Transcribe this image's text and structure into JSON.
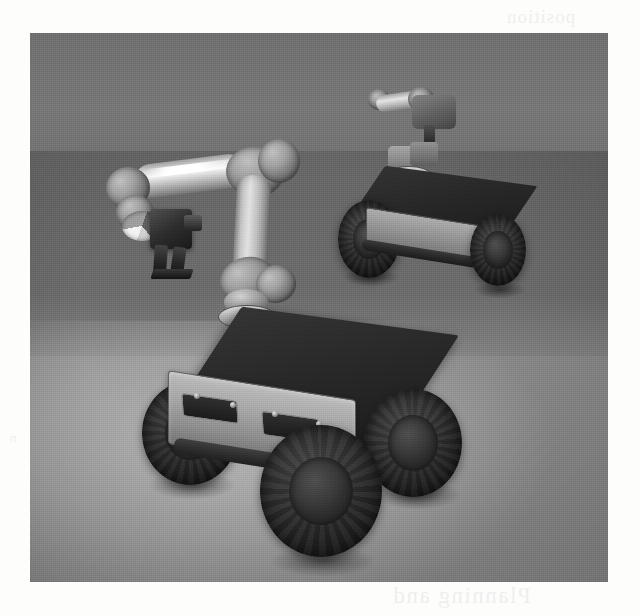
{
  "figure": {
    "domain": "natural-image",
    "caption_visible": false,
    "medium": "scanned-page-halftone",
    "scene_description": "3D robotics simulation viewport showing two wheeled mobile manipulator robots on a tiled floor",
    "frame": {
      "x": 30,
      "y": 33,
      "width": 578,
      "height": 549
    }
  },
  "palette": {
    "paper": "#fdfdfc",
    "wall": "#6f6f6f",
    "floor_light": "#a9a9a9",
    "floor_mid": "#8d8d8d",
    "floor_shadow": "#6a6a6a",
    "tile_line": "#3a3a3a",
    "metal_light": "#e8e8e8",
    "metal_mid": "#9b9b9b",
    "metal_dark": "#6d6d6d",
    "chassis_dark": "#1f1f1f",
    "tyre_black": "#141414",
    "specular": "#ffffff"
  },
  "scene": {
    "environment": {
      "name": "tiled-floor-room",
      "wall_label": "back wall",
      "floor_label": "tiled floor",
      "lighting": "single overhead spot casting a bright pool in the foreground",
      "tile_grid": "square tiles in one-point perspective"
    },
    "objects": [
      {
        "id": "foreground-robot",
        "name": "mobile manipulator robot (foreground)",
        "platform": "four-wheeled skid-steer rover",
        "wheel_count": 4,
        "wheels_visible": 3,
        "arm": "6-axis articulated manipulator arm",
        "end_effector": "two-finger parallel gripper",
        "pose": "arm extended forward and to the left, gripper pointing down",
        "deck_color": "#1f1f1f",
        "chassis_color": "#a0a0a0",
        "tyre_color": "#141414"
      },
      {
        "id": "background-robot",
        "name": "mobile manipulator robot (background)",
        "platform": "four-wheeled skid-steer rover",
        "wheel_count": 4,
        "wheels_visible": 2,
        "arm": "manipulator arm stowed / folded on deck",
        "end_effector": "not visible",
        "pose": "parked, facing left-forward",
        "deck_color": "#1f1f1f",
        "chassis_color": "#8e8e8e",
        "tyre_color": "#141414"
      },
      {
        "id": "floating-arm-fragment",
        "name": "distant robot arm segment",
        "platform": "none (suspended in view)",
        "arm": "two link segments with joints",
        "pose": "horizontal, upper background",
        "chassis_color": "#5b5b5b"
      }
    ]
  },
  "bleed_through": {
    "present": true,
    "note": "faint mirrored text showing through the scanned paper",
    "top_right": "position",
    "bottom_right": "Planning and",
    "left_margin": "n"
  }
}
